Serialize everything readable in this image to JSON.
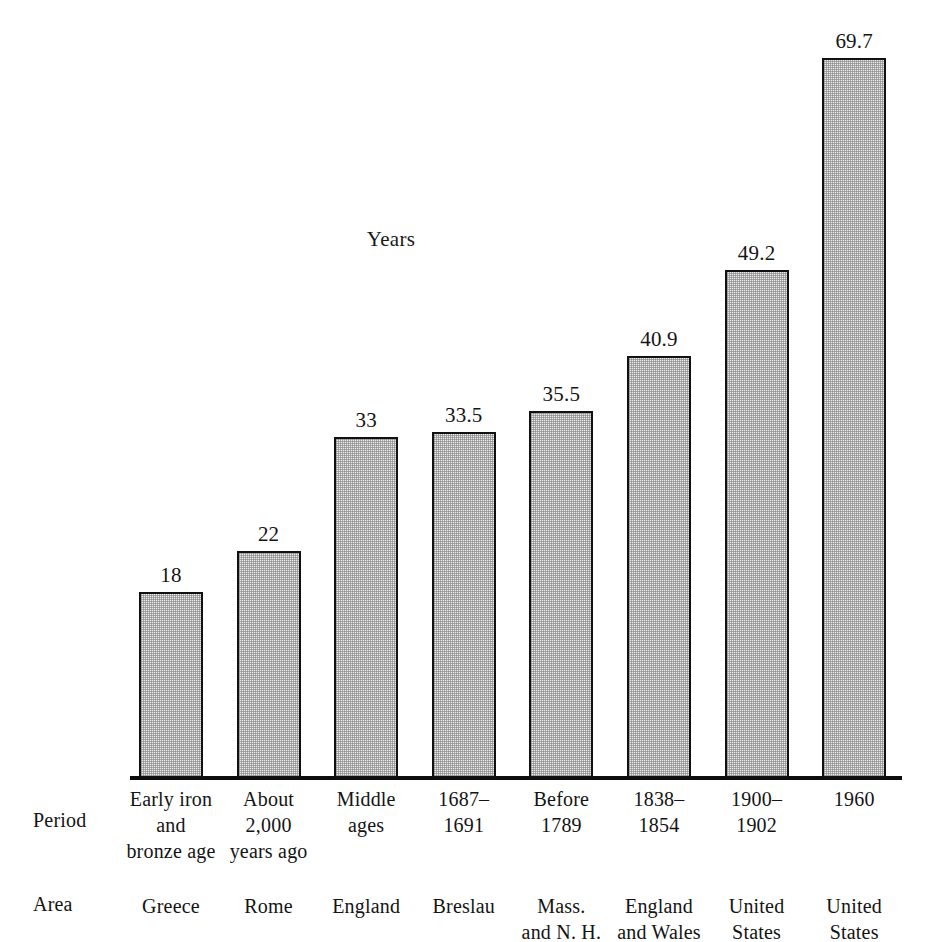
{
  "chart_data": {
    "type": "bar",
    "title": "Years",
    "xlabel": "",
    "ylabel": "Years",
    "ylim": [
      0,
      69.7
    ],
    "grid": false,
    "legend": null,
    "categories": [
      "Early iron and bronze age / Greece",
      "About 2,000 years ago / Rome",
      "Middle ages / England",
      "1687–1691 / Breslau",
      "Before 1789 / Mass. and N. H.",
      "1838–1854 / England and Wales",
      "1900–1902 / United States",
      "1960 / United States"
    ],
    "values": [
      18,
      22,
      33,
      33.5,
      35.5,
      40.9,
      49.2,
      69.7
    ],
    "value_labels": [
      "18",
      "22",
      "33",
      "33.5",
      "35.5",
      "40.9",
      "49.2",
      "69.7"
    ],
    "axis_rows": {
      "period_label": "Period",
      "area_label": "Area",
      "period_values": [
        [
          "Early iron",
          "and",
          "bronze age"
        ],
        [
          "About",
          "2,000",
          "years ago"
        ],
        [
          "Middle",
          "ages"
        ],
        [
          "1687–",
          "1691"
        ],
        [
          "Before",
          "1789"
        ],
        [
          "1838–",
          "1854"
        ],
        [
          "1900–",
          "1902"
        ],
        [
          "1960"
        ]
      ],
      "area_values": [
        [
          "Greece"
        ],
        [
          "Rome"
        ],
        [
          "England"
        ],
        [
          "Breslau"
        ],
        [
          "Mass.",
          "and N. H."
        ],
        [
          "England",
          "and Wales"
        ],
        [
          "United",
          "States"
        ],
        [
          "United",
          "States"
        ]
      ]
    },
    "colors": {
      "bar_fill": "#e9e9e9",
      "bar_stroke": "#111111",
      "text": "#141414",
      "background": "#ffffff"
    }
  }
}
